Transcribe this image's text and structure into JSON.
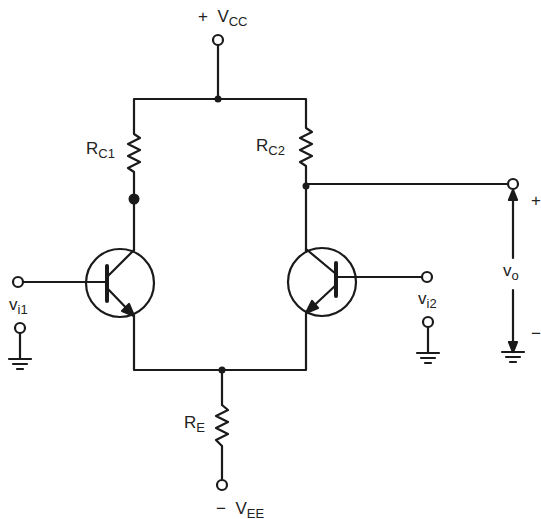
{
  "diagram": {
    "type": "circuit-schematic",
    "colors": {
      "line": "#1a1a1a",
      "background": "#ffffff",
      "text": "#222222"
    },
    "labels": {
      "vcc": {
        "sign": "+",
        "main": "V",
        "sub": "CC"
      },
      "vee": {
        "sign": "−",
        "main": "V",
        "sub": "EE"
      },
      "rc1": {
        "main": "R",
        "sub": "C1"
      },
      "rc2": {
        "main": "R",
        "sub": "C2"
      },
      "re": {
        "main": "R",
        "sub": "E"
      },
      "vi1": {
        "main": "v",
        "sub": "i1"
      },
      "vi2": {
        "main": "v",
        "sub": "i2"
      },
      "vo": {
        "main": "v",
        "sub": "o"
      },
      "vo_plus": "+",
      "vo_minus": "−"
    },
    "components": [
      {
        "id": "RC1",
        "kind": "resistor"
      },
      {
        "id": "RC2",
        "kind": "resistor"
      },
      {
        "id": "RE",
        "kind": "resistor"
      },
      {
        "id": "Q1",
        "kind": "npn-transistor"
      },
      {
        "id": "Q2",
        "kind": "npn-transistor"
      }
    ]
  }
}
